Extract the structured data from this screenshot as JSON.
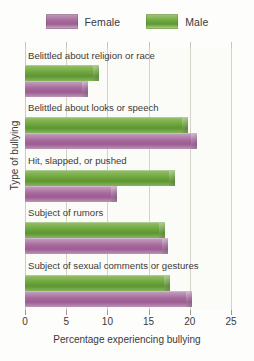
{
  "legend": {
    "entries": [
      {
        "label": "Female",
        "color": "#a7699c",
        "icon": "legend-swatch-female"
      },
      {
        "label": "Male",
        "color": "#6ea73e",
        "icon": "legend-swatch-male"
      }
    ]
  },
  "axes": {
    "xlabel": "Percentage experiencing bullying",
    "ylabel": "Type of bullying",
    "xticks": [
      "0",
      "5",
      "10",
      "15",
      "20",
      "25"
    ]
  },
  "chart_data": {
    "type": "bar",
    "orientation": "horizontal",
    "title": "",
    "xlabel": "Percentage experiencing bullying",
    "ylabel": "Type of bullying",
    "xlim": [
      0,
      25
    ],
    "xticks": [
      0,
      5,
      10,
      15,
      20,
      25
    ],
    "grid": true,
    "legend_position": "top-center",
    "categories": [
      "Belittled about religion or race",
      "Belittled about looks or speech",
      "Hit, slapped, or pushed",
      "Subject of rumors",
      "Subject of sexual comments or gestures"
    ],
    "series": [
      {
        "name": "Male",
        "color": "#6ea73e",
        "values": [
          9.0,
          19.8,
          18.2,
          17.0,
          17.6
        ]
      },
      {
        "name": "Female",
        "color": "#a7699c",
        "values": [
          7.6,
          20.9,
          11.2,
          17.4,
          20.3
        ]
      }
    ]
  }
}
